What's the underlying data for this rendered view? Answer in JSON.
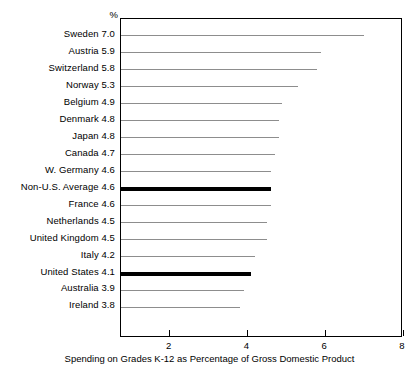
{
  "chart_data": {
    "type": "bar",
    "orientation": "horizontal",
    "title": "",
    "xlabel": "Spending on Grades K-12 as Percentage of Gross Domestic Product",
    "ylabel": "",
    "unit_header": "%",
    "xlim": [
      0.75,
      8
    ],
    "xticks": [
      2,
      4,
      6,
      8
    ],
    "xtick_labels": [
      "2",
      "4",
      "6",
      "8"
    ],
    "grid": false,
    "legend": "none",
    "categories": [
      "Sweden",
      "Austria",
      "Switzerland",
      "Norway",
      "Belgium",
      "Denmark",
      "Japan",
      "Canada",
      "W. Germany",
      "Non-U.S. Average",
      "France",
      "Netherlands",
      "United Kingdom",
      "Italy",
      "United States",
      "Australia",
      "Ireland"
    ],
    "values": [
      7.0,
      5.9,
      5.8,
      5.3,
      4.9,
      4.8,
      4.8,
      4.7,
      4.6,
      4.6,
      4.6,
      4.5,
      4.5,
      4.2,
      4.1,
      3.9,
      3.8
    ],
    "highlighted": [
      "Non-U.S. Average",
      "United States"
    ],
    "rows": [
      {
        "label": "Sweden 7.0",
        "name": "Sweden",
        "value": 7.0,
        "highlight": false
      },
      {
        "label": "Austria 5.9",
        "name": "Austria",
        "value": 5.9,
        "highlight": false
      },
      {
        "label": "Switzerland 5.8",
        "name": "Switzerland",
        "value": 5.8,
        "highlight": false
      },
      {
        "label": "Norway 5.3",
        "name": "Norway",
        "value": 5.3,
        "highlight": false
      },
      {
        "label": "Belgium 4.9",
        "name": "Belgium",
        "value": 4.9,
        "highlight": false
      },
      {
        "label": "Denmark 4.8",
        "name": "Denmark",
        "value": 4.8,
        "highlight": false
      },
      {
        "label": "Japan 4.8",
        "name": "Japan",
        "value": 4.8,
        "highlight": false
      },
      {
        "label": "Canada 4.7",
        "name": "Canada",
        "value": 4.7,
        "highlight": false
      },
      {
        "label": "W. Germany 4.6",
        "name": "W. Germany",
        "value": 4.6,
        "highlight": false
      },
      {
        "label": "Non-U.S. Average 4.6",
        "name": "Non-U.S. Average",
        "value": 4.6,
        "highlight": true
      },
      {
        "label": "France 4.6",
        "name": "France",
        "value": 4.6,
        "highlight": false
      },
      {
        "label": "Netherlands 4.5",
        "name": "Netherlands",
        "value": 4.5,
        "highlight": false
      },
      {
        "label": "United Kingdom 4.5",
        "name": "United Kingdom",
        "value": 4.5,
        "highlight": false
      },
      {
        "label": "Italy 4.2",
        "name": "Italy",
        "value": 4.2,
        "highlight": false
      },
      {
        "label": "United States 4.1",
        "name": "United States",
        "value": 4.1,
        "highlight": true
      },
      {
        "label": "Australia 3.9",
        "name": "Australia",
        "value": 3.9,
        "highlight": false
      },
      {
        "label": "Ireland 3.8",
        "name": "Ireland",
        "value": 3.8,
        "highlight": false
      }
    ],
    "colors": {
      "bar": "#8d8d8d",
      "highlight_bar": "#000000",
      "axis": "#000000",
      "text": "#000000",
      "background": "#ffffff"
    }
  }
}
